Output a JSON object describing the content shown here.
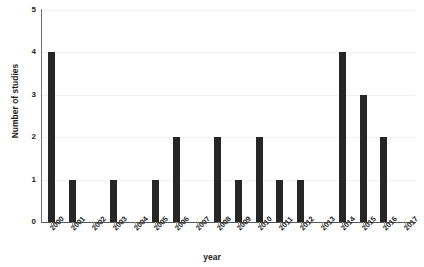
{
  "chart_data": {
    "type": "bar",
    "title": "",
    "xlabel": "year",
    "ylabel": "Number of studies",
    "categories": [
      "2000",
      "2001",
      "2002",
      "2003",
      "2004",
      "2005",
      "2006",
      "2007",
      "2008",
      "2009",
      "2010",
      "2011",
      "2012",
      "2013",
      "2014",
      "2015",
      "2016",
      "2017"
    ],
    "values": [
      4,
      1,
      0,
      1,
      0,
      1,
      2,
      0,
      2,
      1,
      2,
      1,
      1,
      0,
      4,
      3,
      2,
      0
    ],
    "ylim": [
      0,
      5
    ],
    "yticks": [
      "0",
      "1",
      "2",
      "3",
      "4",
      "5"
    ],
    "grid": true,
    "legend": "none",
    "bar_color": "#262626",
    "gridline_color": "#f1f1f3",
    "axis_color": "#58585b"
  },
  "figure": {
    "title_remnant": "· ·· ··"
  }
}
